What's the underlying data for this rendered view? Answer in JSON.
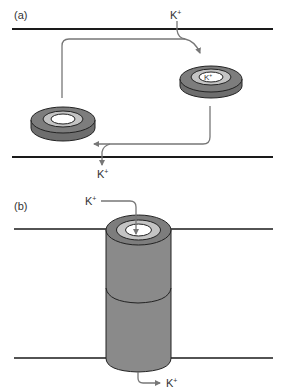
{
  "figure": {
    "panel_a": {
      "label": "(a)",
      "ion_in": "K",
      "ion_in_sup": "+",
      "ion_out": "K",
      "ion_out_sup": "+",
      "ion_bound": "K",
      "ion_bound_sup": "+"
    },
    "panel_b": {
      "label": "(b)",
      "ion_in": "K",
      "ion_in_sup": "+",
      "ion_out": "K",
      "ion_out_sup": "+"
    },
    "colors": {
      "membrane": "#1a1a1a",
      "ring_dark": "#7a7a7a",
      "ring_light": "#c4c4c4",
      "ring_outline": "#222222",
      "arrow": "#777777",
      "cylinder": "#8a8a8a"
    }
  }
}
